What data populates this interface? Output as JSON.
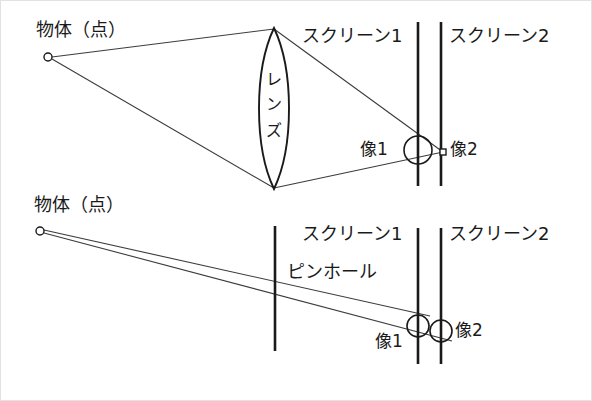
{
  "figure": {
    "stroke_color": "#1a1a1a",
    "ray_color": "#3c3c3c",
    "background": "#ffffff"
  },
  "top_diagram": {
    "name": "lens-imaging",
    "object_label": "物体（点）",
    "lens_label": "レンズ",
    "screen1_label": "スクリーン1",
    "screen2_label": "スクリーン2",
    "image1_label": "像1",
    "image2_label": "像2",
    "object_point": {
      "x": 48,
      "y": 57
    },
    "lens": {
      "cx": 274,
      "top_y": 28,
      "bottom_y": 189,
      "half_width": 20
    },
    "screen1_x": 418,
    "screen2_x": 441,
    "screen_top_y": 22,
    "screen_bottom_y": 186,
    "focus_point": {
      "x": 443,
      "y": 152
    },
    "blur_circle": {
      "cx": 418,
      "cy": 150,
      "r": 14
    }
  },
  "bottom_diagram": {
    "name": "pinhole-imaging",
    "object_label": "物体（点）",
    "pinhole_label": "ピンホール",
    "screen1_label": "スクリーン1",
    "screen2_label": "スクリーン2",
    "image1_label": "像1",
    "image2_label": "像2",
    "object_point": {
      "x": 40,
      "y": 231
    },
    "pinhole_x": 275,
    "pinhole_top_y": 226,
    "pinhole_bottom_y": 351,
    "screen1_x": 418,
    "screen2_x": 441,
    "screen_top_y": 228,
    "screen_bottom_y": 364,
    "blur_circle_1": {
      "cx": 418,
      "cy": 326,
      "r": 11
    },
    "blur_circle_2": {
      "cx": 441,
      "cy": 331,
      "r": 11
    }
  },
  "labels": {
    "top_object": "物体（点）",
    "top_lens": "レンズ",
    "top_screen1": "スクリーン1",
    "top_screen2": "スクリーン2",
    "top_image1": "像1",
    "top_image2": "像2",
    "bottom_object": "物体（点）",
    "bottom_pinhole": "ピンホール",
    "bottom_screen1": "スクリーン1",
    "bottom_screen2": "スクリーン2",
    "bottom_image1": "像1",
    "bottom_image2": "像2",
    "lens_char_1": "レ",
    "lens_char_2": "ン",
    "lens_char_3": "ズ"
  }
}
